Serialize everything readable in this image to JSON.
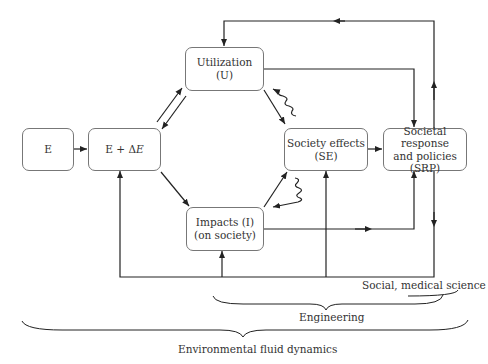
{
  "diagram": {
    "nodes": {
      "e": {
        "line1": "E"
      },
      "e_delta": {
        "prefix": "E + Δ",
        "var": "E"
      },
      "utilization": {
        "line1": "Utilization",
        "line2": "(U)"
      },
      "impacts": {
        "line1": "Impacts (I)",
        "line2": "(on society)"
      },
      "society_effects": {
        "line1": "Society effects",
        "line2": "(SE)"
      },
      "srp": {
        "line1": "Societal response",
        "line2": "and policies",
        "line3": "(SRP)"
      }
    },
    "edges": [
      {
        "from": "E",
        "to": "E + ΔE"
      },
      {
        "from": "E + ΔE",
        "to": "Utilization (U)"
      },
      {
        "from": "Utilization (U)",
        "to": "E + ΔE"
      },
      {
        "from": "E + ΔE",
        "to": "Impacts (I)"
      },
      {
        "from": "Utilization (U)",
        "to": "Society effects (SE)"
      },
      {
        "from": "Impacts (I)",
        "to": "Society effects (SE)"
      },
      {
        "from": "Society effects (SE)",
        "to": "Utilization (U)",
        "style": "wavy"
      },
      {
        "from": "Society effects (SE)",
        "to": "Impacts (I)",
        "style": "wavy"
      },
      {
        "from": "Society effects (SE)",
        "to": "SRP"
      },
      {
        "from": "Utilization (U)",
        "to": "SRP"
      },
      {
        "from": "Impacts (I)",
        "to": "SRP"
      },
      {
        "from": "SRP",
        "to": "Utilization (U)",
        "via": "top feedback line"
      },
      {
        "from": "SRP",
        "to": "E + ΔE",
        "via": "bottom feedback line"
      },
      {
        "from": "SRP",
        "to": "Impacts (I)",
        "via": "bottom feedback line"
      },
      {
        "from": "SRP",
        "to": "Society effects (SE)",
        "via": "bottom feedback line"
      }
    ],
    "braces": {
      "social": "Social, medical science",
      "engineering": "Engineering",
      "environmental": "Environmental fluid dynamics"
    }
  },
  "colors": {
    "line": "#222222",
    "box_border": "#777777",
    "text": "#333333"
  }
}
